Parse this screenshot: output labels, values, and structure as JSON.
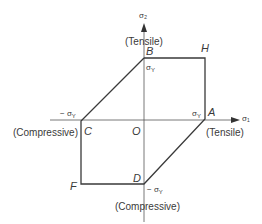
{
  "diagram": {
    "axes": {
      "x_axis_label": "σ₁",
      "y_axis_label": "σ₂",
      "top_label": "(Tensile)",
      "bottom_label": "(Compressive)",
      "left_label": "(Compressive)",
      "right_label": "(Tensile)"
    },
    "points": {
      "origin": "O",
      "A": "A",
      "B": "B",
      "C": "C",
      "D": "D",
      "F": "F",
      "H": "H"
    },
    "tick_labels": {
      "pos_sigma_y_vertical": "σ",
      "pos_sigma_y_vertical_sub": "Y",
      "pos_sigma_y_horizontal": "σ",
      "pos_sigma_y_horizontal_sub": "Y",
      "neg_sigma_y_horizontal": "− σ",
      "neg_sigma_y_horizontal_sub": "Y",
      "neg_sigma_y_vertical": "− σ",
      "neg_sigma_y_vertical_sub": "Y"
    },
    "colors": {
      "line": "#3a3a3a",
      "axis": "#555555",
      "background": "#ffffff"
    }
  }
}
